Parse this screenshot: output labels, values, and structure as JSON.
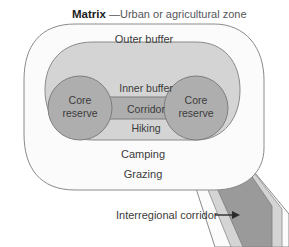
{
  "figure": {
    "title_bold": "Matrix",
    "title_rest": "—Urban or agricultural zone",
    "zones": {
      "outer_buffer": "Outer buffer",
      "inner_buffer": "Inner buffer",
      "corridor": "Corridor",
      "core_reserve_left": "Core\nreserve",
      "core_reserve_left_line1": "Core",
      "core_reserve_left_line2": "reserve",
      "core_reserve_right_line1": "Core",
      "core_reserve_right_line2": "reserve"
    },
    "activities": {
      "hiking": "Hiking",
      "camping": "Camping",
      "grazing": "Grazing"
    },
    "annotation": {
      "interregional_corridor": "Interregional corridor",
      "arrow": "arrow-right-icon"
    },
    "colors": {
      "core_reserve_fill": "#aeaeae",
      "inner_buffer_fill": "#d4d4d4",
      "outer_buffer_fill": "#fbfbfb",
      "matrix_background": "#ffffff",
      "outline_stroke": "#8a8a8a",
      "corridor_dark_fill": "#9a9a9a",
      "label_text": "#3b3b3b",
      "title_text": "#1d1d1d"
    }
  }
}
